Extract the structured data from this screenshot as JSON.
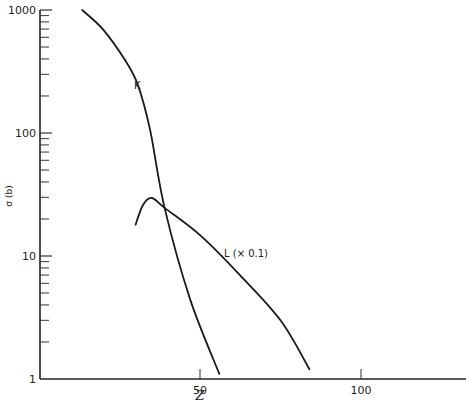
{
  "chart_data": {
    "type": "line",
    "title": "",
    "xlabel": "Z",
    "ylabel": "σ (b)",
    "xlim": [
      0,
      130
    ],
    "ylim": [
      1,
      1000
    ],
    "yscale": "log",
    "x_ticks": [
      50,
      100
    ],
    "x_tick_labels": [
      "50",
      "100"
    ],
    "y_ticks": [
      1,
      10,
      100,
      1000
    ],
    "y_tick_labels": [
      "1",
      "10",
      "100",
      "1000"
    ],
    "grid": false,
    "legend": "none (curves labeled directly)",
    "series": [
      {
        "name": "K",
        "label": "K",
        "x": [
          13.4,
          20,
          26.7,
          30.7,
          34.5,
          39,
          47,
          56
        ],
        "y": [
          1000,
          690,
          392,
          246,
          106,
          24.6,
          4.4,
          1.1
        ]
      },
      {
        "name": "L (× 0.1)",
        "label": "L (× 0.1)",
        "x": [
          30,
          32.3,
          35,
          39,
          50,
          62.4,
          75,
          84
        ],
        "y": [
          18,
          26,
          29.6,
          24.6,
          14.8,
          7,
          3,
          1.2
        ]
      }
    ],
    "annotations": [
      {
        "text": "K",
        "x": 31,
        "y": 350
      },
      {
        "text": "L (× 0.1)",
        "x": 57,
        "y": 11
      }
    ]
  },
  "labels": {
    "xlabel": "Z",
    "ylabel": "σ (b)",
    "k_label": "K",
    "l_label": "L (× 0.1)"
  }
}
